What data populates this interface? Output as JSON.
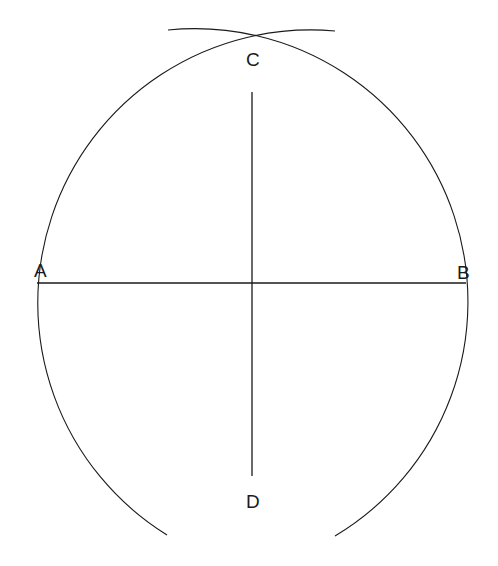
{
  "diagram": {
    "labels": {
      "A": "A",
      "B": "B",
      "C": "C",
      "D": "D"
    },
    "points": {
      "A": [
        37,
        283
      ],
      "B": [
        466,
        283
      ],
      "C": [
        252,
        92
      ],
      "D": [
        252,
        476
      ]
    },
    "arcs": [
      {
        "name": "arc-centered-right",
        "center": [
          446,
          283
        ],
        "radius": 273
      },
      {
        "name": "arc-centered-left",
        "center": [
          58,
          283
        ],
        "radius": 273
      }
    ],
    "colors": {
      "line": "#1a1a1a",
      "background": "#ffffff"
    }
  }
}
